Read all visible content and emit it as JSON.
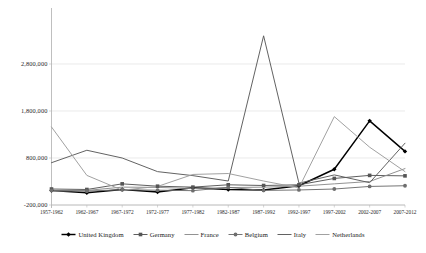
{
  "chart_data": {
    "type": "line",
    "title": "",
    "xlabel": "",
    "ylabel": "",
    "grid": true,
    "legend_position": "bottom",
    "ylim": [
      -200000,
      3800000
    ],
    "yticks": [
      -200000,
      800000,
      1800000,
      2800000
    ],
    "ytick_labels": [
      "-200,000",
      "800,000",
      "1,800,000",
      "2,800,000"
    ],
    "categories": [
      "1957-1962",
      "1962-1967",
      "1967-1972",
      "1972-1977",
      "1977-1982",
      "1982-1987",
      "1987-1992",
      "1992-1997",
      "1997-2002",
      "2002-2007",
      "2007-2012"
    ],
    "series": [
      {
        "name": "United Kingdom",
        "color": "#000000",
        "marker": "diamond",
        "values": [
          110000,
          60000,
          130000,
          75000,
          165000,
          130000,
          120000,
          210000,
          560000,
          1590000,
          940000
        ]
      },
      {
        "name": "Germany",
        "color": "#555555",
        "marker": "square",
        "values": [
          140000,
          130000,
          250000,
          200000,
          180000,
          230000,
          215000,
          230000,
          365000,
          430000,
          420000
        ]
      },
      {
        "name": "France",
        "color": "#8c8c8c",
        "marker": "none",
        "values": [
          95000,
          110000,
          180000,
          175000,
          150000,
          170000,
          180000,
          200000,
          250000,
          300000,
          575000
        ]
      },
      {
        "name": "Belgium",
        "color": "#6e6e6e",
        "marker": "circle",
        "values": [
          110000,
          95000,
          125000,
          115000,
          105000,
          175000,
          110000,
          120000,
          140000,
          195000,
          210000
        ]
      },
      {
        "name": "Italy",
        "color": "#5a5a5a",
        "marker": "none",
        "values": [
          700000,
          965000,
          800000,
          510000,
          425000,
          310000,
          3400000,
          265000,
          440000,
          275000,
          1115000
        ]
      },
      {
        "name": "Netherlands",
        "color": "#9c9c9c",
        "marker": "none",
        "values": [
          1460000,
          430000,
          115000,
          195000,
          450000,
          470000,
          310000,
          165000,
          1680000,
          1030000,
          510000
        ]
      }
    ]
  },
  "legend": {
    "items": [
      {
        "label": "United Kingdom",
        "color": "#000000",
        "marker": "diamond"
      },
      {
        "label": "Germany",
        "color": "#555555",
        "marker": "square"
      },
      {
        "label": "France",
        "color": "#8c8c8c",
        "marker": "none"
      },
      {
        "label": "Belgium",
        "color": "#6e6e6e",
        "marker": "circle"
      },
      {
        "label": "Italy",
        "color": "#5a5a5a",
        "marker": "none"
      },
      {
        "label": "Netherlands",
        "color": "#9c9c9c",
        "marker": "none"
      }
    ]
  },
  "axes": {
    "grid_color": "#dcdcdc",
    "axis_color": "#b8b8b8"
  }
}
